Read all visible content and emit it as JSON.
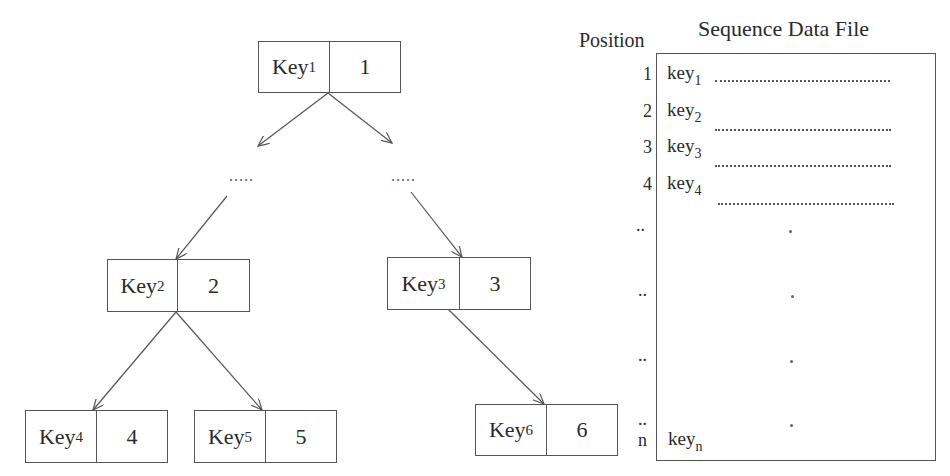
{
  "tree": {
    "nodes": [
      {
        "id": "n1",
        "key": "Key",
        "sub": "1",
        "value": "1"
      },
      {
        "id": "n2",
        "key": "Key",
        "sub": "2",
        "value": "2"
      },
      {
        "id": "n3",
        "key": "Key",
        "sub": "3",
        "value": "3"
      },
      {
        "id": "n4",
        "key": "Key",
        "sub": "4",
        "value": "4"
      },
      {
        "id": "n5",
        "key": "Key",
        "sub": "5",
        "value": "5"
      },
      {
        "id": "n6",
        "key": "Key",
        "sub": "6",
        "value": "6"
      }
    ],
    "ellipsis_left": ".....",
    "ellipsis_right": "....."
  },
  "sequence_file": {
    "title": "Sequence Data File",
    "position_label": "Position",
    "records": [
      {
        "pos": "1",
        "key": "key",
        "sub": "1"
      },
      {
        "pos": "2",
        "key": "key",
        "sub": "2"
      },
      {
        "pos": "3",
        "key": "key",
        "sub": "3"
      },
      {
        "pos": "4",
        "key": "key",
        "sub": "4"
      },
      {
        "pos": "..",
        "key": "",
        "sub": ""
      },
      {
        "pos": "..",
        "key": "",
        "sub": ""
      },
      {
        "pos": "..",
        "key": "",
        "sub": ""
      },
      {
        "pos": "..",
        "key": "",
        "sub": ""
      },
      {
        "pos": "n",
        "key": "key",
        "sub": "n"
      }
    ]
  }
}
